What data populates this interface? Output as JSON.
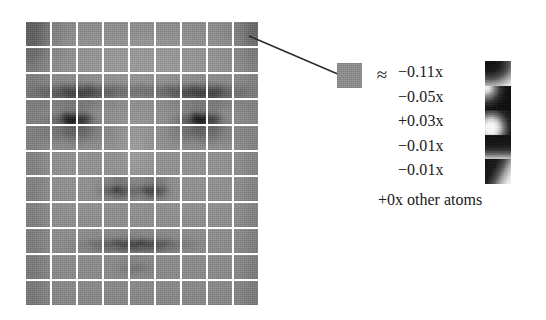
{
  "figure": {
    "type": "sparse-coding-illustration",
    "approx_symbol": "≈",
    "other_atoms_label": "+0x other atoms"
  },
  "face_grid": {
    "name": "face-patch-grid",
    "columns": 9,
    "rows": 11,
    "description": "grayscale face image partitioned into rectangular patches",
    "highlighted_patch": {
      "row": 1,
      "col": 9
    }
  },
  "selected_patch": {
    "name": "selected-patch",
    "description": "single gray image patch extracted from top-right of the face grid"
  },
  "coefficients": [
    {
      "label": "−0.11x",
      "sign": "-",
      "value": -0.11,
      "atom": "atom-1"
    },
    {
      "label": "−0.05x",
      "sign": "-",
      "value": -0.05,
      "atom": "atom-2"
    },
    {
      "label": "+0.03x",
      "sign": "+",
      "value": 0.03,
      "atom": "atom-3"
    },
    {
      "label": "−0.01x",
      "sign": "-",
      "value": -0.01,
      "atom": "atom-4"
    },
    {
      "label": "−0.01x",
      "sign": "-",
      "value": -0.01,
      "atom": "atom-5"
    }
  ],
  "atoms": [
    {
      "name": "atom-1",
      "pattern": "dark blob upper-left, bright lower-right"
    },
    {
      "name": "atom-2",
      "pattern": "bright upper-left corner, dark right"
    },
    {
      "name": "atom-3",
      "pattern": "bright white blob lower-left, dark upper-right"
    },
    {
      "name": "atom-4",
      "pattern": "dark horizontal band across top, lighter bottom"
    },
    {
      "name": "atom-5",
      "pattern": "dark upper-left, bright lower-left diagonal"
    }
  ],
  "colors": {
    "background": "#ffffff",
    "ink": "#1a1a1a",
    "patch_mid_gray": "#8a8a8a",
    "leader_line": "#2b2b2b"
  }
}
